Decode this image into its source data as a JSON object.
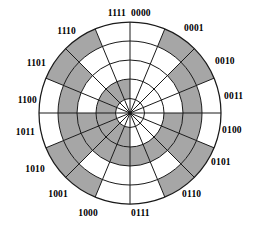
{
  "figure": {
    "type": "gray-code-wheel",
    "title": "",
    "bits": 4,
    "sector_count": 16,
    "ring_count": 4,
    "center": {
      "x": 130,
      "y": 113
    },
    "radii": [
      14.5,
      34,
      53,
      72,
      91
    ],
    "start_angle_deg": -90,
    "colors": {
      "shaded": "#a6a6a6",
      "unshaded": "#ffffff",
      "stroke": "#1a1a1a",
      "text": "#000000",
      "background": "#ffffff"
    }
  },
  "chart_data": {
    "type": "pie",
    "title": "",
    "xlabel": "",
    "ylabel": "",
    "legend": [],
    "grid": false,
    "categories": [
      "0000",
      "0001",
      "0010",
      "0011",
      "0100",
      "0101",
      "0110",
      "0111",
      "1000",
      "1001",
      "1010",
      "1011",
      "1100",
      "1101",
      "1110",
      "1111"
    ],
    "values": [
      1,
      1,
      1,
      1,
      1,
      1,
      1,
      1,
      1,
      1,
      1,
      1,
      1,
      1,
      1,
      1
    ],
    "series": [
      {
        "name": "ring-1-inner-bit-b3",
        "ring_index": 0,
        "values": [
          0,
          0,
          0,
          0,
          0,
          0,
          0,
          0,
          1,
          1,
          1,
          1,
          1,
          1,
          1,
          1
        ]
      },
      {
        "name": "ring-2-bit-b2",
        "ring_index": 1,
        "values": [
          0,
          0,
          0,
          0,
          1,
          1,
          1,
          1,
          1,
          1,
          1,
          1,
          0,
          0,
          0,
          0
        ]
      },
      {
        "name": "ring-3-bit-b1",
        "ring_index": 2,
        "values": [
          0,
          0,
          1,
          1,
          1,
          1,
          0,
          0,
          0,
          0,
          1,
          1,
          1,
          1,
          0,
          0
        ]
      },
      {
        "name": "ring-4-outer-bit-b0",
        "ring_index": 3,
        "values": [
          0,
          1,
          1,
          0,
          0,
          1,
          1,
          0,
          0,
          1,
          1,
          0,
          0,
          1,
          1,
          0
        ]
      }
    ]
  },
  "labels": [
    {
      "text": "0000",
      "sector": 0,
      "x": 131,
      "y": 9,
      "align": "left"
    },
    {
      "text": "0001",
      "sector": 1,
      "x": 184,
      "y": 24,
      "align": "left"
    },
    {
      "text": "0010",
      "sector": 2,
      "x": 215,
      "y": 57,
      "align": "left"
    },
    {
      "text": "0011",
      "sector": 3,
      "x": 224,
      "y": 92,
      "align": "left"
    },
    {
      "text": "0100",
      "sector": 4,
      "x": 222,
      "y": 126,
      "align": "left"
    },
    {
      "text": "0101",
      "sector": 5,
      "x": 211,
      "y": 158,
      "align": "left"
    },
    {
      "text": "0110",
      "sector": 6,
      "x": 182,
      "y": 190,
      "align": "left"
    },
    {
      "text": "0111",
      "sector": 7,
      "x": 131,
      "y": 209,
      "align": "left"
    },
    {
      "text": "1000",
      "sector": 8,
      "x": 98,
      "y": 209,
      "align": "right"
    },
    {
      "text": "1001",
      "sector": 9,
      "x": 68,
      "y": 190,
      "align": "right"
    },
    {
      "text": "1010",
      "sector": 10,
      "x": 45,
      "y": 165,
      "align": "right"
    },
    {
      "text": "1011",
      "sector": 11,
      "x": 35,
      "y": 128,
      "align": "right"
    },
    {
      "text": "1100",
      "sector": 12,
      "x": 37,
      "y": 96,
      "align": "right"
    },
    {
      "text": "1101",
      "sector": 13,
      "x": 46,
      "y": 59,
      "align": "right"
    },
    {
      "text": "1110",
      "sector": 14,
      "x": 76,
      "y": 27,
      "align": "right"
    },
    {
      "text": "1111",
      "sector": 15,
      "x": 126,
      "y": 9,
      "align": "right"
    }
  ]
}
